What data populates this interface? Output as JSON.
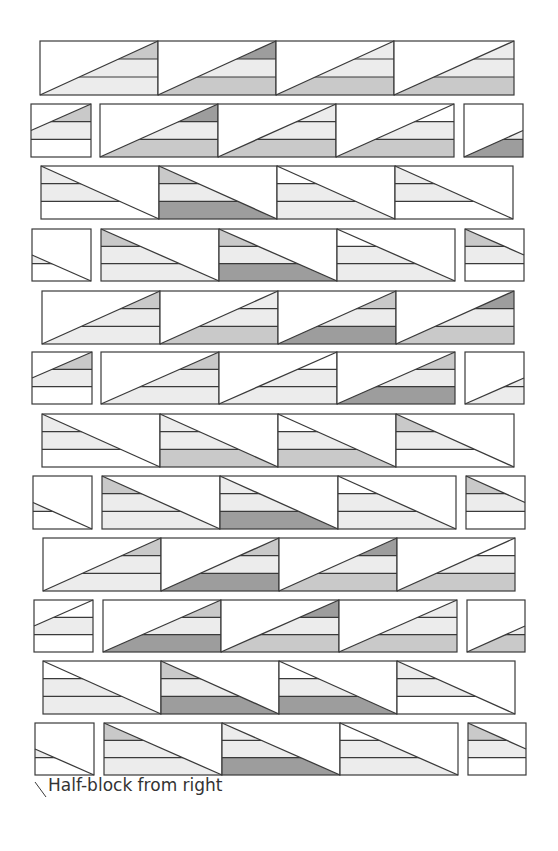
{
  "colors": {
    "W": "#ffffff",
    "L": "#ececec",
    "M": "#c9c9c9",
    "D": "#9d9d9d",
    "stroke": "#3a3a3a"
  },
  "caption": "Half-block from right",
  "rows": [
    {
      "y": 41,
      "h": 54,
      "type": "full",
      "dir": "up",
      "blocks": [
        {
          "x": 40,
          "w": 118,
          "s": [
            "M",
            "L",
            "L"
          ]
        },
        {
          "x": 158,
          "w": 118,
          "s": [
            "D",
            "L",
            "M"
          ]
        },
        {
          "x": 276,
          "w": 118,
          "s": [
            "L",
            "L",
            "M"
          ]
        },
        {
          "x": 394,
          "w": 120,
          "s": [
            "L",
            "L",
            "M"
          ]
        }
      ]
    },
    {
      "y": 104,
      "h": 53,
      "type": "split",
      "dir": "up",
      "blocks": [
        {
          "x": 31,
          "w": 60,
          "half": "right",
          "s": [
            "M",
            "L",
            "W"
          ]
        },
        {
          "x": 100,
          "w": 118,
          "s": [
            "D",
            "L",
            "M"
          ]
        },
        {
          "x": 218,
          "w": 118,
          "s": [
            "L",
            "L",
            "M"
          ]
        },
        {
          "x": 336,
          "w": 118,
          "s": [
            "W",
            "L",
            "M"
          ]
        },
        {
          "x": 464,
          "w": 59,
          "half": "left",
          "s": [
            "M",
            "L",
            "D"
          ]
        }
      ]
    },
    {
      "y": 166,
      "h": 53,
      "type": "full",
      "dir": "down",
      "blocks": [
        {
          "x": 41,
          "w": 118,
          "s": [
            "L",
            "L",
            "W"
          ]
        },
        {
          "x": 159,
          "w": 118,
          "s": [
            "M",
            "L",
            "D"
          ]
        },
        {
          "x": 277,
          "w": 118,
          "s": [
            "W",
            "L",
            "L"
          ]
        },
        {
          "x": 395,
          "w": 118,
          "s": [
            "L",
            "L",
            "W"
          ]
        }
      ]
    },
    {
      "y": 229,
      "h": 52,
      "type": "split",
      "dir": "down",
      "blocks": [
        {
          "x": 32,
          "w": 59,
          "half": "right",
          "s": [
            "M",
            "L",
            "W"
          ]
        },
        {
          "x": 101,
          "w": 118,
          "s": [
            "M",
            "L",
            "L"
          ]
        },
        {
          "x": 219,
          "w": 118,
          "s": [
            "M",
            "L",
            "D"
          ]
        },
        {
          "x": 337,
          "w": 118,
          "s": [
            "W",
            "L",
            "L"
          ]
        },
        {
          "x": 465,
          "w": 59,
          "half": "left",
          "s": [
            "M",
            "L",
            "W"
          ]
        }
      ]
    },
    {
      "y": 291,
      "h": 53,
      "type": "full",
      "dir": "up",
      "blocks": [
        {
          "x": 42,
          "w": 118,
          "s": [
            "M",
            "L",
            "L"
          ]
        },
        {
          "x": 160,
          "w": 118,
          "s": [
            "L",
            "L",
            "M"
          ]
        },
        {
          "x": 278,
          "w": 118,
          "s": [
            "M",
            "L",
            "D"
          ]
        },
        {
          "x": 396,
          "w": 118,
          "s": [
            "D",
            "L",
            "M"
          ]
        }
      ]
    },
    {
      "y": 352,
      "h": 52,
      "type": "split",
      "dir": "up",
      "blocks": [
        {
          "x": 32,
          "w": 60,
          "half": "right",
          "s": [
            "M",
            "L",
            "W"
          ]
        },
        {
          "x": 101,
          "w": 118,
          "s": [
            "M",
            "L",
            "L"
          ]
        },
        {
          "x": 219,
          "w": 118,
          "s": [
            "W",
            "L",
            "L"
          ]
        },
        {
          "x": 337,
          "w": 118,
          "s": [
            "M",
            "L",
            "D"
          ]
        },
        {
          "x": 465,
          "w": 59,
          "half": "left",
          "s": [
            "M",
            "L",
            "L"
          ]
        }
      ]
    },
    {
      "y": 414,
      "h": 53,
      "type": "full",
      "dir": "down",
      "blocks": [
        {
          "x": 42,
          "w": 118,
          "s": [
            "L",
            "L",
            "W"
          ]
        },
        {
          "x": 160,
          "w": 118,
          "s": [
            "L",
            "L",
            "M"
          ]
        },
        {
          "x": 278,
          "w": 118,
          "s": [
            "W",
            "L",
            "M"
          ]
        },
        {
          "x": 396,
          "w": 118,
          "s": [
            "M",
            "L",
            "W"
          ]
        }
      ]
    },
    {
      "y": 476,
      "h": 53,
      "type": "split",
      "dir": "down",
      "blocks": [
        {
          "x": 33,
          "w": 59,
          "half": "right",
          "s": [
            "M",
            "L",
            "W"
          ]
        },
        {
          "x": 102,
          "w": 118,
          "s": [
            "M",
            "L",
            "L"
          ]
        },
        {
          "x": 220,
          "w": 118,
          "s": [
            "L",
            "L",
            "D"
          ]
        },
        {
          "x": 338,
          "w": 118,
          "s": [
            "W",
            "L",
            "L"
          ]
        },
        {
          "x": 466,
          "w": 59,
          "half": "left",
          "s": [
            "M",
            "L",
            "W"
          ]
        }
      ]
    },
    {
      "y": 538,
      "h": 53,
      "type": "full",
      "dir": "up",
      "blocks": [
        {
          "x": 43,
          "w": 118,
          "s": [
            "M",
            "L",
            "L"
          ]
        },
        {
          "x": 161,
          "w": 118,
          "s": [
            "M",
            "L",
            "D"
          ]
        },
        {
          "x": 279,
          "w": 118,
          "s": [
            "D",
            "L",
            "M"
          ]
        },
        {
          "x": 397,
          "w": 118,
          "s": [
            "W",
            "L",
            "M"
          ]
        }
      ]
    },
    {
      "y": 600,
      "h": 52,
      "type": "split",
      "dir": "up",
      "blocks": [
        {
          "x": 34,
          "w": 59,
          "half": "right",
          "s": [
            "W",
            "L",
            "W"
          ]
        },
        {
          "x": 103,
          "w": 118,
          "s": [
            "M",
            "L",
            "D"
          ]
        },
        {
          "x": 221,
          "w": 118,
          "s": [
            "D",
            "L",
            "M"
          ]
        },
        {
          "x": 339,
          "w": 118,
          "s": [
            "L",
            "L",
            "M"
          ]
        },
        {
          "x": 467,
          "w": 58,
          "half": "left",
          "s": [
            "W",
            "L",
            "M"
          ]
        }
      ]
    },
    {
      "y": 661,
      "h": 53,
      "type": "full",
      "dir": "down",
      "blocks": [
        {
          "x": 43,
          "w": 118,
          "s": [
            "W",
            "L",
            "L"
          ]
        },
        {
          "x": 161,
          "w": 118,
          "s": [
            "M",
            "L",
            "D"
          ]
        },
        {
          "x": 279,
          "w": 118,
          "s": [
            "W",
            "L",
            "D"
          ]
        },
        {
          "x": 397,
          "w": 118,
          "s": [
            "L",
            "L",
            "W"
          ]
        }
      ]
    },
    {
      "y": 723,
      "h": 52,
      "type": "split",
      "dir": "down",
      "blocks": [
        {
          "x": 35,
          "w": 59,
          "half": "right",
          "s": [
            "M",
            "L",
            "W"
          ]
        },
        {
          "x": 104,
          "w": 118,
          "s": [
            "M",
            "L",
            "L"
          ]
        },
        {
          "x": 222,
          "w": 118,
          "s": [
            "L",
            "L",
            "D"
          ]
        },
        {
          "x": 340,
          "w": 118,
          "s": [
            "W",
            "L",
            "L"
          ]
        },
        {
          "x": 468,
          "w": 58,
          "half": "left",
          "s": [
            "M",
            "L",
            "W"
          ]
        }
      ]
    }
  ]
}
